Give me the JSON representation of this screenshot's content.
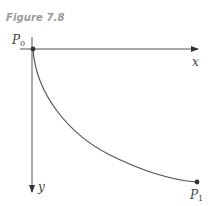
{
  "figure": {
    "caption": "Figure 7.8",
    "type": "brachistochrone diagram",
    "axes": {
      "x_label": "x",
      "y_label": "y",
      "x_direction": "right",
      "y_direction": "down"
    },
    "points": [
      {
        "name": "P0",
        "main": "P",
        "sub": "0",
        "position": "origin"
      },
      {
        "name": "P1",
        "main": "P",
        "sub": "1",
        "position": "lower-right endpoint"
      }
    ],
    "curve": "cycloid arc from P0 to P1",
    "colors": {
      "caption": "#9a9a9a",
      "lines": "#555555",
      "labels": "#444444"
    }
  }
}
